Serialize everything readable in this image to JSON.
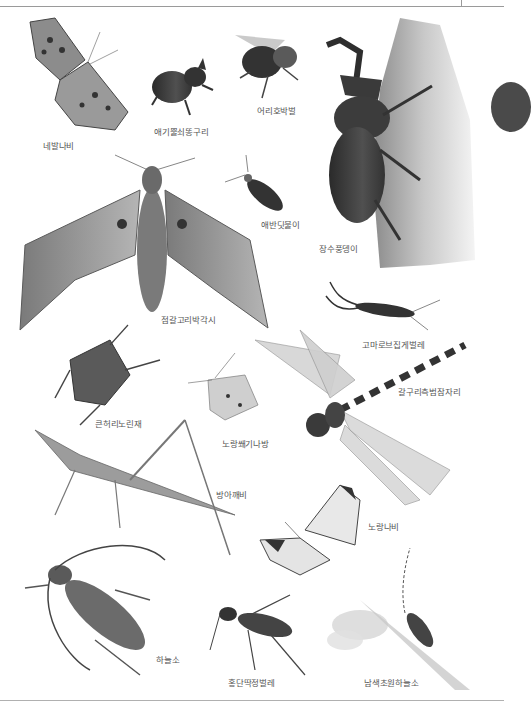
{
  "page": {
    "theme": "grayscale scientific illustration",
    "colors": {
      "rule": "#9a9a9a",
      "label_text": "#555555",
      "tab_marker": "#4a4a4a"
    }
  },
  "insects": [
    {
      "id": "butterfly-comma",
      "label": "네발나비"
    },
    {
      "id": "dung-beetle",
      "label": "애기뿔쇠똥구리"
    },
    {
      "id": "bumblebee",
      "label": "어리호박벌"
    },
    {
      "id": "rhinoceros-beetle",
      "label": "장수풍뎅이"
    },
    {
      "id": "firefly",
      "label": "애반딧불이"
    },
    {
      "id": "hawk-moth",
      "label": "점갈고리박각시"
    },
    {
      "id": "earwig",
      "label": "고마로브집게벌레"
    },
    {
      "id": "dragonfly",
      "label": "갈구리측범잠자리"
    },
    {
      "id": "stink-bug",
      "label": "큰허리노린재"
    },
    {
      "id": "tiger-moth",
      "label": "노랑쐐기나방"
    },
    {
      "id": "grasshopper",
      "label": "방아깨비"
    },
    {
      "id": "white-butterfly",
      "label": "노랑나비"
    },
    {
      "id": "longhorn-beetle",
      "label": "하늘소"
    },
    {
      "id": "ground-beetle",
      "label": "홍단딱정벌레"
    },
    {
      "id": "blue-longhorn",
      "label": "남색초원하늘소"
    }
  ]
}
